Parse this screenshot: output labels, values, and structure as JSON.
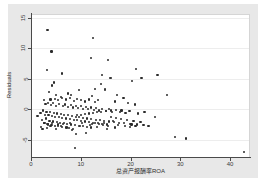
{
  "chart_data": {
    "type": "scatter",
    "title": "",
    "xlabel": "总资产报酬率ROA",
    "ylabel": "Residuals",
    "xlim": [
      0,
      44
    ],
    "ylim": [
      -8,
      15.5
    ],
    "xticks": [
      0,
      10,
      20,
      30,
      40
    ],
    "yticks": [
      -5,
      0,
      5,
      10,
      15
    ],
    "xtick_labels": [
      "0",
      "10",
      "20",
      "30",
      "40"
    ],
    "ytick_labels": [
      "-5",
      "0",
      "5",
      "10",
      "15"
    ],
    "grid": "horizontal",
    "legend": "none",
    "marker_color": "#2b2b2b",
    "plot_background": "#ffffff",
    "figure_background": "#e8e8e8",
    "points": [
      [
        3.3,
        13.1
      ],
      [
        12.5,
        11.7
      ],
      [
        4.1,
        9.5
      ],
      [
        12.1,
        8.5
      ],
      [
        15.5,
        8.1
      ],
      [
        3.2,
        6.4
      ],
      [
        21.1,
        6.6
      ],
      [
        6.3,
        5.9
      ],
      [
        14.3,
        5.6
      ],
      [
        25.4,
        5.6
      ],
      [
        15.8,
        5.2
      ],
      [
        16.0,
        5.1
      ],
      [
        22.2,
        5.2
      ],
      [
        20.3,
        4.6
      ],
      [
        14.1,
        4.2
      ],
      [
        4.6,
        4.4
      ],
      [
        4.3,
        3.9
      ],
      [
        9.6,
        3.2
      ],
      [
        12.8,
        3.4
      ],
      [
        14.8,
        3.3
      ],
      [
        14.9,
        3.2
      ],
      [
        27.3,
        2.4
      ],
      [
        5.0,
        2.3
      ],
      [
        3.6,
        2.8
      ],
      [
        7.4,
        2.6
      ],
      [
        8.1,
        2.4
      ],
      [
        17.3,
        2.3
      ],
      [
        12.3,
        2.2
      ],
      [
        18.6,
        1.9
      ],
      [
        6.0,
        2.0
      ],
      [
        2.6,
        1.5
      ],
      [
        3.9,
        1.6
      ],
      [
        4.8,
        1.7
      ],
      [
        5.5,
        1.5
      ],
      [
        6.2,
        1.9
      ],
      [
        7.0,
        1.6
      ],
      [
        7.8,
        1.8
      ],
      [
        8.6,
        1.4
      ],
      [
        9.2,
        1.7
      ],
      [
        10.1,
        1.5
      ],
      [
        10.8,
        1.3
      ],
      [
        11.6,
        1.6
      ],
      [
        12.9,
        1.2
      ],
      [
        13.5,
        1.5
      ],
      [
        16.8,
        1.3
      ],
      [
        19.5,
        1.1
      ],
      [
        20.9,
        0.8
      ],
      [
        2.9,
        0.9
      ],
      [
        3.4,
        1.1
      ],
      [
        4.0,
        0.7
      ],
      [
        4.5,
        1.0
      ],
      [
        5.1,
        0.6
      ],
      [
        5.7,
        0.9
      ],
      [
        6.4,
        0.5
      ],
      [
        6.9,
        0.8
      ],
      [
        7.5,
        0.4
      ],
      [
        8.0,
        0.7
      ],
      [
        8.5,
        0.3
      ],
      [
        9.0,
        0.6
      ],
      [
        9.5,
        0.2
      ],
      [
        10.0,
        0.5
      ],
      [
        10.5,
        0.1
      ],
      [
        11.0,
        0.4
      ],
      [
        11.5,
        0.0
      ],
      [
        12.0,
        0.3
      ],
      [
        12.6,
        -0.1
      ],
      [
        13.1,
        0.2
      ],
      [
        13.7,
        -0.2
      ],
      [
        14.2,
        0.1
      ],
      [
        15.0,
        -0.3
      ],
      [
        15.6,
        0.0
      ],
      [
        16.2,
        -0.4
      ],
      [
        17.0,
        -0.1
      ],
      [
        17.8,
        -0.5
      ],
      [
        18.2,
        -0.2
      ],
      [
        19.0,
        -0.6
      ],
      [
        19.8,
        -0.3
      ],
      [
        21.5,
        -0.7
      ],
      [
        22.8,
        -0.4
      ],
      [
        1.9,
        -0.6
      ],
      [
        2.4,
        -0.2
      ],
      [
        2.8,
        -0.9
      ],
      [
        3.1,
        -0.4
      ],
      [
        3.5,
        -1.0
      ],
      [
        3.8,
        -0.5
      ],
      [
        4.2,
        -1.1
      ],
      [
        4.6,
        -0.6
      ],
      [
        4.9,
        -1.2
      ],
      [
        5.3,
        -0.7
      ],
      [
        5.6,
        -1.3
      ],
      [
        6.0,
        -0.8
      ],
      [
        6.3,
        -1.4
      ],
      [
        6.7,
        -0.9
      ],
      [
        7.1,
        -1.5
      ],
      [
        7.4,
        -1.0
      ],
      [
        7.8,
        -1.6
      ],
      [
        8.2,
        -1.1
      ],
      [
        8.6,
        -1.7
      ],
      [
        9.0,
        -1.2
      ],
      [
        9.3,
        -1.8
      ],
      [
        9.7,
        -1.3
      ],
      [
        10.1,
        -1.9
      ],
      [
        10.5,
        -1.4
      ],
      [
        10.9,
        -2.0
      ],
      [
        11.3,
        -1.5
      ],
      [
        11.7,
        -2.1
      ],
      [
        12.1,
        -1.6
      ],
      [
        12.5,
        -2.2
      ],
      [
        13.0,
        -1.7
      ],
      [
        13.4,
        -2.3
      ],
      [
        13.8,
        -1.8
      ],
      [
        14.3,
        -2.4
      ],
      [
        14.7,
        -1.9
      ],
      [
        15.2,
        -2.5
      ],
      [
        15.7,
        -2.0
      ],
      [
        16.1,
        -1.2
      ],
      [
        16.6,
        -2.1
      ],
      [
        17.1,
        -1.4
      ],
      [
        17.6,
        -2.2
      ],
      [
        18.1,
        -1.6
      ],
      [
        18.7,
        -2.3
      ],
      [
        19.3,
        -1.8
      ],
      [
        20.0,
        -2.4
      ],
      [
        20.6,
        -1.9
      ],
      [
        21.3,
        -2.5
      ],
      [
        22.0,
        -2.1
      ],
      [
        22.6,
        -2.6
      ],
      [
        2.2,
        -1.8
      ],
      [
        2.6,
        -2.3
      ],
      [
        3.0,
        -1.5
      ],
      [
        3.4,
        -2.5
      ],
      [
        3.7,
        -1.9
      ],
      [
        4.1,
        -2.6
      ],
      [
        4.4,
        -2.0
      ],
      [
        4.8,
        -2.7
      ],
      [
        5.2,
        -2.1
      ],
      [
        5.5,
        -2.8
      ],
      [
        5.9,
        -2.2
      ],
      [
        6.2,
        -2.9
      ],
      [
        6.6,
        -2.3
      ],
      [
        7.0,
        -3.0
      ],
      [
        7.3,
        -2.4
      ],
      [
        7.7,
        -3.1
      ],
      [
        8.1,
        -2.5
      ],
      [
        8.4,
        -3.2
      ],
      [
        8.8,
        -2.6
      ],
      [
        9.2,
        -1.0
      ],
      [
        9.6,
        -2.7
      ],
      [
        10.0,
        -0.9
      ],
      [
        10.4,
        -2.8
      ],
      [
        10.8,
        -0.8
      ],
      [
        11.2,
        -2.9
      ],
      [
        11.6,
        -0.7
      ],
      [
        12.0,
        -3.0
      ],
      [
        12.4,
        -0.6
      ],
      [
        12.8,
        -2.2
      ],
      [
        13.2,
        -0.5
      ],
      [
        13.6,
        -2.4
      ],
      [
        14.0,
        -0.4
      ],
      [
        14.5,
        -2.6
      ],
      [
        15.1,
        -0.3
      ],
      [
        15.5,
        -2.8
      ],
      [
        16.0,
        -0.2
      ],
      [
        16.4,
        -1.9
      ],
      [
        1.3,
        -1.1
      ],
      [
        2.0,
        -2.9
      ],
      [
        2.3,
        -3.3
      ],
      [
        3.2,
        -3.1
      ],
      [
        3.9,
        -2.8
      ],
      [
        5.0,
        -3.3
      ],
      [
        6.1,
        -2.7
      ],
      [
        7.2,
        -3.0
      ],
      [
        8.3,
        -3.4
      ],
      [
        9.1,
        -4.0
      ],
      [
        9.9,
        -2.8
      ],
      [
        11.1,
        -3.9
      ],
      [
        11.9,
        -2.6
      ],
      [
        13.3,
        -2.9
      ],
      [
        14.6,
        -2.3
      ],
      [
        17.4,
        -2.6
      ],
      [
        18.9,
        -2.8
      ],
      [
        20.2,
        -2.5
      ],
      [
        21.0,
        -2.7
      ],
      [
        8.9,
        -6.3
      ],
      [
        28.9,
        -4.5
      ],
      [
        31.2,
        -4.8
      ],
      [
        42.8,
        -7.0
      ],
      [
        24.9,
        -1.3
      ],
      [
        23.6,
        -2.7
      ],
      [
        19.9,
        -2.9
      ],
      [
        16.9,
        -3.0
      ],
      [
        15.3,
        -3.2
      ],
      [
        12.2,
        -2.4
      ],
      [
        10.3,
        -2.3
      ],
      [
        7.9,
        -2.2
      ],
      [
        6.5,
        -2.4
      ],
      [
        5.4,
        -2.5
      ],
      [
        4.3,
        -2.3
      ],
      [
        3.3,
        -2.4
      ],
      [
        2.7,
        -2.2
      ]
    ]
  }
}
